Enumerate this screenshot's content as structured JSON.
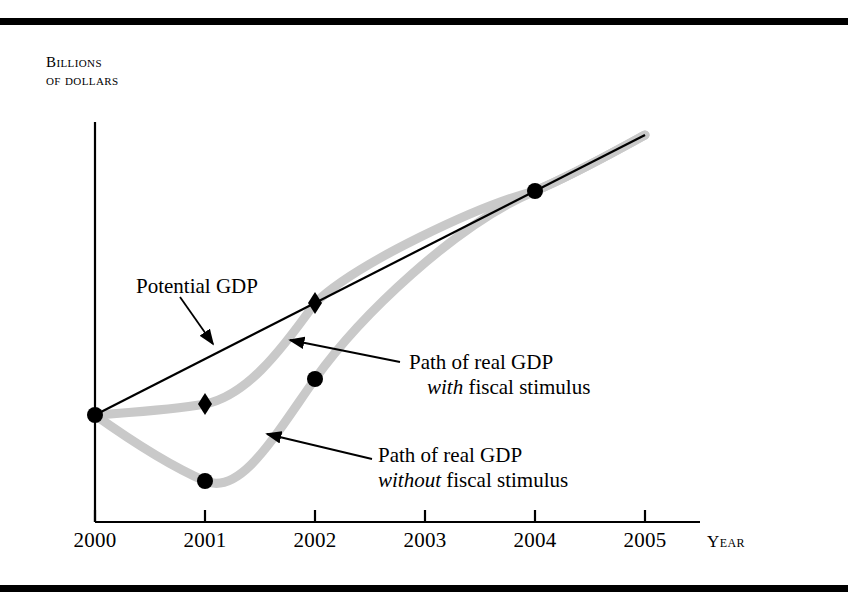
{
  "figure": {
    "y_axis_title_line1": "Billions",
    "y_axis_title_line2": "of dollars",
    "x_axis_title": "Year"
  },
  "annotations": {
    "potential_gdp": "Potential GDP",
    "with_stimulus_line1": "Path of real GDP",
    "with_stimulus_emph": "with",
    "with_stimulus_rest": " fiscal stimulus",
    "without_stimulus_line1": "Path of real GDP",
    "without_stimulus_emph": "without",
    "without_stimulus_rest": " fiscal stimulus"
  },
  "colors": {
    "potential_line": "#000000",
    "real_gdp_curve": "#c9c9c9",
    "marker": "#000000",
    "axis": "#000000",
    "rule": "#000000",
    "background": "#ffffff"
  },
  "ticks": [
    {
      "label": "2000",
      "x": 95
    },
    {
      "label": "2001",
      "x": 205
    },
    {
      "label": "2002",
      "x": 315
    },
    {
      "label": "2003",
      "x": 425
    },
    {
      "label": "2004",
      "x": 535
    },
    {
      "label": "2005",
      "x": 645
    }
  ],
  "chart_data": {
    "type": "line",
    "title": "",
    "xlabel": "Year",
    "ylabel": "Billions of dollars",
    "xlim": [
      2000,
      2005
    ],
    "ylim": [
      0,
      100
    ],
    "grid": false,
    "legend": "annotations-on-plot",
    "x": [
      2000,
      2001,
      2002,
      2003,
      2004,
      2005
    ],
    "series": [
      {
        "name": "Potential GDP",
        "style": "straight-thin-black-line",
        "marker": "none",
        "values": [
          36,
          50,
          64,
          78,
          92,
          106
        ],
        "pixels": [
          {
            "x": 95,
            "y": 415
          },
          {
            "x": 205,
            "y": 359
          },
          {
            "x": 315,
            "y": 303
          },
          {
            "x": 425,
            "y": 247
          },
          {
            "x": 535,
            "y": 191
          },
          {
            "x": 645,
            "y": 135
          }
        ]
      },
      {
        "name": "Path of real GDP with fiscal stimulus",
        "style": "thick-light-gray-curve",
        "marker": "diamond",
        "values": [
          36,
          38,
          64,
          78,
          92,
          106
        ],
        "pixels": [
          {
            "x": 95,
            "y": 415
          },
          {
            "x": 205,
            "y": 404
          },
          {
            "x": 315,
            "y": 303
          },
          {
            "x": 425,
            "y": 247
          },
          {
            "x": 535,
            "y": 191
          },
          {
            "x": 645,
            "y": 135
          }
        ],
        "markers_at": [
          2000,
          2001,
          2002
        ]
      },
      {
        "name": "Path of real GDP without fiscal stimulus",
        "style": "thick-light-gray-curve",
        "marker": "circle",
        "values": [
          36,
          19,
          45,
          70,
          92,
          106
        ],
        "pixels": [
          {
            "x": 95,
            "y": 415
          },
          {
            "x": 205,
            "y": 481
          },
          {
            "x": 315,
            "y": 379
          },
          {
            "x": 425,
            "y": 270
          },
          {
            "x": 535,
            "y": 191
          },
          {
            "x": 645,
            "y": 135
          }
        ],
        "markers_at": [
          2000,
          2001,
          2002,
          2004
        ]
      }
    ],
    "markers": [
      {
        "series": "shared-origin",
        "shape": "circle",
        "x": 95,
        "y": 415,
        "year": 2000
      },
      {
        "series": "with",
        "shape": "diamond",
        "x": 205,
        "y": 404,
        "year": 2001
      },
      {
        "series": "with",
        "shape": "diamond",
        "x": 315,
        "y": 303,
        "year": 2002
      },
      {
        "series": "without",
        "shape": "circle",
        "x": 205,
        "y": 481,
        "year": 2001
      },
      {
        "series": "without",
        "shape": "circle",
        "x": 315,
        "y": 379,
        "year": 2002
      },
      {
        "series": "without",
        "shape": "circle",
        "x": 535,
        "y": 191,
        "year": 2004
      }
    ],
    "axes": {
      "y_axis": {
        "x": 95,
        "y_top": 122,
        "y_bottom": 522
      },
      "x_axis": {
        "y": 522,
        "x_left": 95,
        "x_right": 700
      },
      "tick_length": 12
    }
  }
}
